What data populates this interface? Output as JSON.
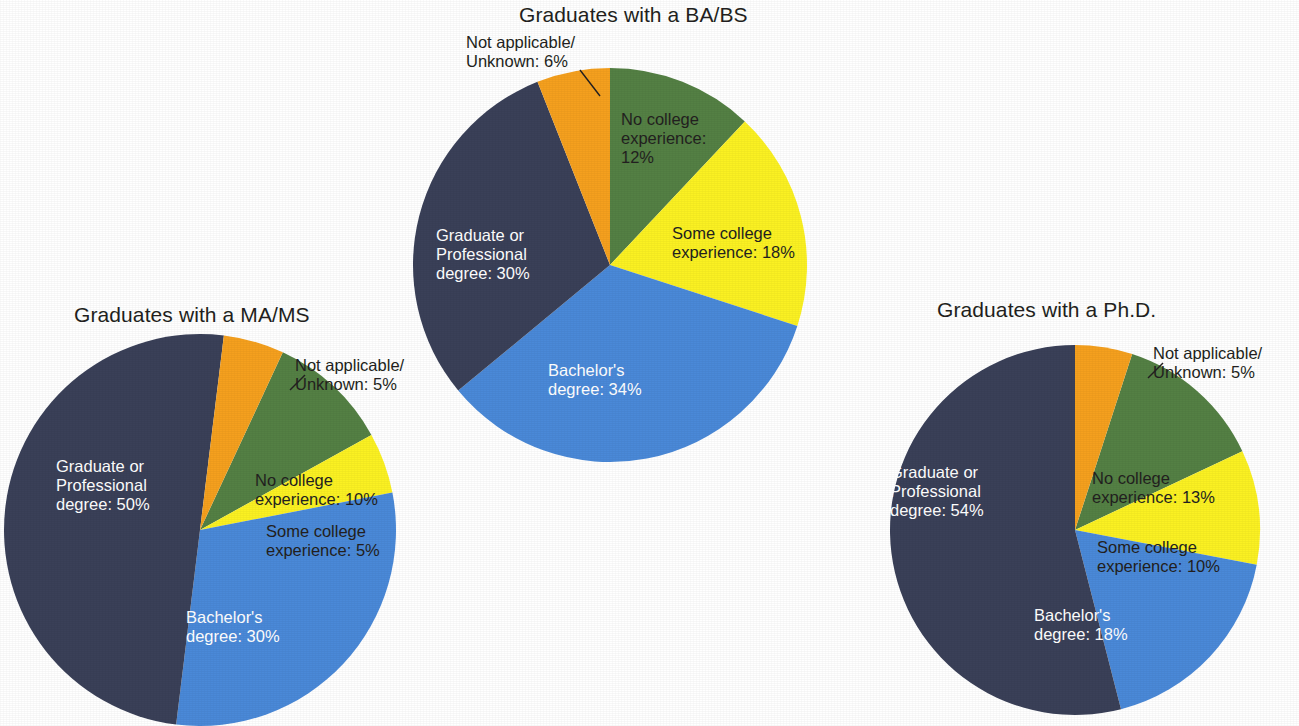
{
  "page": {
    "background": "#ffffff",
    "palette": {
      "graduate_professional": "#3a4058",
      "bachelors": "#4a89d8",
      "some_college": "#fbf122",
      "no_college": "#548044",
      "not_applicable": "#f5a01e",
      "text_dark": "#231f20",
      "text_light": "#ffffff"
    }
  },
  "chart_data": [
    {
      "type": "pie",
      "id": "babs",
      "title": "Graduates with a BA/BS",
      "categories": [
        "No college experience",
        "Some college experience",
        "Bachelor's degree",
        "Graduate or Professional degree",
        "Not applicable/Unknown"
      ],
      "values": [
        12,
        18,
        34,
        30,
        6
      ],
      "unit": "%",
      "colors": [
        "#548044",
        "#fbf122",
        "#4a89d8",
        "#3a4058",
        "#f5a01e"
      ],
      "start_angle_deg": 0,
      "direction": "clockwise",
      "legend": "none",
      "labels": {
        "no_college": "No college\nexperience:\n12%",
        "some_college": "Some college\nexperience: 18%",
        "bachelors": "Bachelor's\ndegree: 34%",
        "graduate": "Graduate or\nProfessional\ndegree: 30%",
        "not_applicable": "Not applicable/\nUnknown: 6%"
      }
    },
    {
      "type": "pie",
      "id": "mams",
      "title": "Graduates with a MA/MS",
      "categories": [
        "No college experience",
        "Some college experience",
        "Bachelor's degree",
        "Graduate or Professional degree",
        "Not applicable/Unknown"
      ],
      "values": [
        10,
        5,
        30,
        50,
        5
      ],
      "unit": "%",
      "colors": [
        "#548044",
        "#fbf122",
        "#4a89d8",
        "#3a4058",
        "#f5a01e"
      ],
      "start_angle_deg": 25,
      "direction": "clockwise",
      "legend": "none",
      "labels": {
        "no_college": "No college\nexperience: 10%",
        "some_college": "Some college\nexperience: 5%",
        "bachelors": "Bachelor's\ndegree: 30%",
        "graduate": "Graduate or\nProfessional\ndegree: 50%",
        "not_applicable": "Not applicable/\nUnknown: 5%"
      }
    },
    {
      "type": "pie",
      "id": "phd",
      "title": "Graduates with a Ph.D.",
      "categories": [
        "No college experience",
        "Some college experience",
        "Bachelor's degree",
        "Graduate or Professional degree",
        "Not applicable/Unknown"
      ],
      "values": [
        13,
        10,
        18,
        54,
        5
      ],
      "unit": "%",
      "colors": [
        "#548044",
        "#fbf122",
        "#4a89d8",
        "#3a4058",
        "#f5a01e"
      ],
      "start_angle_deg": 18,
      "direction": "clockwise",
      "legend": "none",
      "labels": {
        "no_college": "No college\nexperience: 13%",
        "some_college": "Some college\nexperience: 10%",
        "bachelors": "Bachelor's\ndegree: 18%",
        "graduate": "Graduate or\nProfessional\ndegree: 54%",
        "not_applicable": "Not applicable/\nUnknown: 5%"
      }
    }
  ]
}
